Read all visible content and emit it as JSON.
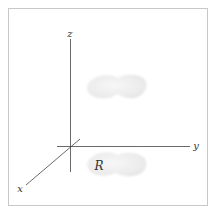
{
  "diagram": {
    "type": "3d-coordinate-projection",
    "axes": {
      "x": {
        "label": "x"
      },
      "y": {
        "label": "y"
      },
      "z": {
        "label": "z"
      }
    },
    "regions": {
      "upper_surface": {
        "label": ""
      },
      "base_region": {
        "label": "R"
      }
    },
    "colors": {
      "frame": "#c8c8c8",
      "axis": "#444444",
      "blob": "#ececec",
      "background": "#ffffff"
    }
  }
}
